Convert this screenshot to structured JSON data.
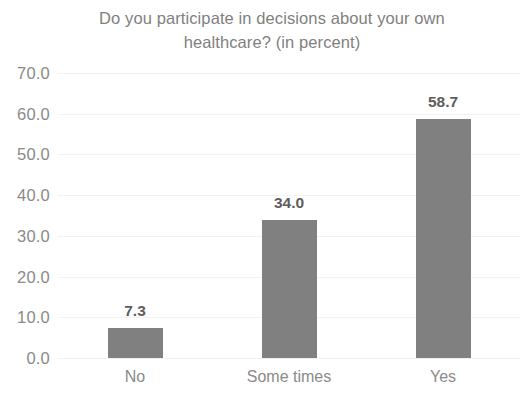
{
  "chart_data": {
    "type": "bar",
    "title": "Do you participate in decisions about your own healthcare? (in percent)",
    "title_line1": "Do you participate in decisions about your own",
    "title_line2": "healthcare? (in percent)",
    "categories": [
      "No",
      "Some times",
      "Yes"
    ],
    "values": [
      7.3,
      34.0,
      58.7
    ],
    "data_labels": [
      "7.3",
      "34.0",
      "58.7"
    ],
    "series": [
      {
        "name": "percent",
        "values": [
          7.3,
          34.0,
          58.7
        ]
      }
    ],
    "xlabel": "",
    "ylabel": "",
    "ylim": [
      0.0,
      70.0
    ],
    "y_tick_step": 10.0,
    "y_tick_labels": [
      "70.0",
      "60.0",
      "50.0",
      "40.0",
      "30.0",
      "20.0",
      "10.0",
      "0.0"
    ],
    "y_tick_values": [
      70.0,
      60.0,
      50.0,
      40.0,
      30.0,
      20.0,
      10.0,
      0.0
    ],
    "grid": true,
    "grid_orientation": "horizontal",
    "legend": false,
    "legend_position": "none",
    "bar_color": "#808080",
    "gridline_color": "#f2f2f2",
    "title_color": "#7f7f7f",
    "tick_label_color": "#8a8a8a",
    "data_label_color": "#5d5d5d",
    "background_color": "#ffffff"
  }
}
